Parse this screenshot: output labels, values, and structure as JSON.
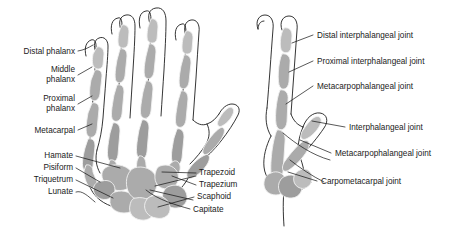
{
  "figure": {
    "background_color": "#ffffff",
    "bone_color": "#ababab",
    "outline_color": "#111111",
    "text_color": "#1a1a1a",
    "views": [
      {
        "name": "dorsal-palmar-view",
        "description": "Anterior view of the hand skeleton showing phalanges, metacarpals and carpal bones"
      },
      {
        "name": "lateral-view",
        "description": "Lateral view of the hand skeleton showing the joints of a finger and the thumb"
      }
    ]
  },
  "left_panel": {
    "name": "bone-names-panel",
    "labels_left": [
      {
        "id": "distal-phalanx",
        "text": "Distal phalanx",
        "lines": [
          "Distal phalanx"
        ]
      },
      {
        "id": "middle-phalanx",
        "text": "Middle phalanx",
        "lines": [
          "Middle",
          "phalanx"
        ]
      },
      {
        "id": "proximal-phalanx",
        "text": "Proximal phalanx",
        "lines": [
          "Proximal",
          "phalanx"
        ]
      },
      {
        "id": "metacarpal",
        "text": "Metacarpal",
        "lines": [
          "Metacarpal"
        ]
      },
      {
        "id": "hamate",
        "text": "Hamate",
        "lines": [
          "Hamate"
        ]
      },
      {
        "id": "pisiform",
        "text": "Pisiform",
        "lines": [
          "Pisiform"
        ]
      },
      {
        "id": "triquetrum",
        "text": "Triquetrum",
        "lines": [
          "Triquetrum"
        ]
      },
      {
        "id": "lunate",
        "text": "Lunate",
        "lines": [
          "Lunate"
        ]
      }
    ],
    "labels_right": [
      {
        "id": "trapezoid",
        "text": "Trapezoid"
      },
      {
        "id": "trapezium",
        "text": "Trapezium"
      },
      {
        "id": "scaphoid",
        "text": "Scaphoid"
      },
      {
        "id": "capitate",
        "text": "Capitate"
      }
    ]
  },
  "right_panel": {
    "name": "joint-names-panel",
    "labels": [
      {
        "id": "distal-interphalangeal-joint",
        "text": "Distal interphalangeal joint"
      },
      {
        "id": "proximal-interphalangeal-joint",
        "text": "Proximal interphalangeal joint"
      },
      {
        "id": "metacarpophalangeal-joint-finger",
        "text": "Metacarpophalangeal joint"
      },
      {
        "id": "interphalangeal-joint",
        "text": "Interphalangeal joint"
      },
      {
        "id": "metacarpophalangeal-joint-thumb",
        "text": "Metacarpophalangeal joint"
      },
      {
        "id": "carpometacarpal-joint",
        "text": "Carpometacarpal joint"
      }
    ]
  }
}
